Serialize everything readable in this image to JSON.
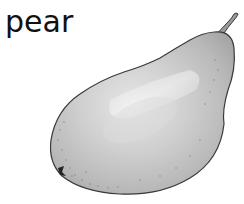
{
  "label": {
    "text": "pear"
  },
  "illustration": {
    "subject": "pear",
    "style": "grayscale pencil illustration",
    "colors": {
      "body_light": "#e2e2e2",
      "body_mid": "#c4c4c4",
      "body_dark": "#9e9e9e",
      "outline": "#3a3a3a",
      "stem": "#8a8a8a"
    }
  }
}
